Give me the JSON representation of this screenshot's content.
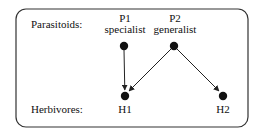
{
  "diagram": {
    "type": "food-web",
    "colors": {
      "stroke": "#222222",
      "node": "#111111",
      "background": "#ffffff"
    },
    "rows": {
      "top": {
        "label": "Parasitoids:"
      },
      "bottom": {
        "label": "Herbivores:"
      }
    },
    "nodes": [
      {
        "id": "P1",
        "name": "P1",
        "role": "specialist",
        "level": "parasitoid"
      },
      {
        "id": "P2",
        "name": "P2",
        "role": "generalist",
        "level": "parasitoid"
      },
      {
        "id": "H1",
        "name": "H1",
        "level": "herbivore"
      },
      {
        "id": "H2",
        "name": "H2",
        "level": "herbivore"
      }
    ],
    "edges": [
      {
        "from": "P1",
        "to": "H1"
      },
      {
        "from": "P2",
        "to": "H1"
      },
      {
        "from": "P2",
        "to": "H2"
      }
    ]
  }
}
